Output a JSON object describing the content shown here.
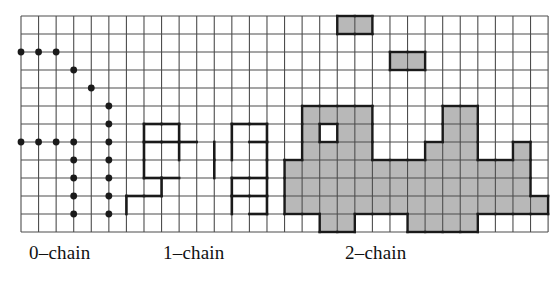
{
  "figure": {
    "background_color": "#ffffff",
    "ink_color": "#1a1a1a",
    "grid_line_color": "#4d4d4d",
    "fill_color": "#b8b8b8",
    "grid": {
      "origin_x": 21,
      "origin_y": 16,
      "cell_w": 17.57,
      "cell_h": 18.0,
      "cols": 30,
      "rows": 12,
      "line_width": 1.1
    },
    "styles": {
      "vertex_radius": 3.4,
      "edge_width": 2.6,
      "face_outline_width": 2.4
    }
  },
  "captions": [
    {
      "name": "zero-chain-label",
      "text": "0–chain",
      "x": 29,
      "y": 242
    },
    {
      "name": "one-chain-label",
      "text": "1–chain",
      "x": 163,
      "y": 242
    },
    {
      "name": "two-chain-label",
      "text": "2–chain",
      "x": 345,
      "y": 242
    }
  ],
  "chain_data": {
    "type": "diagram",
    "description": "Simplicial chains drawn on a 30x12 square lattice: 0-chain as marked vertices, 1-chain as highlighted edges, 2-chain as shaded faces.",
    "zero_chain": {
      "label": "0–chain",
      "element_type": "vertex",
      "count": 19,
      "vertices": [
        [
          0,
          2
        ],
        [
          1,
          2
        ],
        [
          2,
          2
        ],
        [
          3,
          3
        ],
        [
          4,
          4
        ],
        [
          5,
          5
        ],
        [
          5,
          6
        ],
        [
          5,
          7
        ],
        [
          5,
          8
        ],
        [
          5,
          9
        ],
        [
          5,
          10
        ],
        [
          5,
          11
        ],
        [
          0,
          7
        ],
        [
          1,
          7
        ],
        [
          2,
          7
        ],
        [
          3,
          7
        ],
        [
          3,
          8
        ],
        [
          3,
          9
        ],
        [
          3,
          10
        ],
        [
          3,
          11
        ]
      ]
    },
    "one_chain": {
      "label": "1–chain",
      "element_type": "edge",
      "count": 26,
      "horizontal_edges": [
        [
          7,
          7
        ],
        [
          8,
          7
        ],
        [
          9,
          7
        ],
        [
          7,
          9
        ],
        [
          8,
          9
        ],
        [
          6,
          10
        ],
        [
          7,
          10
        ],
        [
          7,
          6
        ],
        [
          8,
          6
        ],
        [
          12,
          6
        ],
        [
          13,
          6
        ],
        [
          13,
          7
        ],
        [
          12,
          9
        ],
        [
          13,
          9
        ],
        [
          12,
          10
        ],
        [
          13,
          10
        ],
        [
          13,
          11
        ]
      ],
      "vertical_edges": [
        [
          7,
          6
        ],
        [
          9,
          6
        ],
        [
          9,
          7
        ],
        [
          7,
          7
        ],
        [
          7,
          8
        ],
        [
          8,
          9
        ],
        [
          6,
          10
        ],
        [
          11,
          7
        ],
        [
          11,
          8
        ],
        [
          12,
          6
        ],
        [
          14,
          6
        ],
        [
          12,
          7
        ],
        [
          14,
          7
        ],
        [
          14,
          8
        ],
        [
          12,
          9
        ],
        [
          12,
          10
        ],
        [
          14,
          9
        ],
        [
          14,
          10
        ]
      ]
    },
    "two_chain": {
      "label": "2–chain",
      "element_type": "face",
      "count": 72,
      "filled_cells": [
        [
          18,
          0
        ],
        [
          19,
          0
        ],
        [
          21,
          2
        ],
        [
          22,
          2
        ],
        [
          16,
          5
        ],
        [
          17,
          5
        ],
        [
          18,
          5
        ],
        [
          19,
          5
        ],
        [
          24,
          5
        ],
        [
          25,
          5
        ],
        [
          16,
          6
        ],
        [
          18,
          6
        ],
        [
          19,
          6
        ],
        [
          24,
          6
        ],
        [
          25,
          6
        ],
        [
          16,
          7
        ],
        [
          17,
          7
        ],
        [
          18,
          7
        ],
        [
          19,
          7
        ],
        [
          23,
          7
        ],
        [
          24,
          7
        ],
        [
          25,
          7
        ],
        [
          28,
          7
        ],
        [
          15,
          8
        ],
        [
          16,
          8
        ],
        [
          17,
          8
        ],
        [
          18,
          8
        ],
        [
          19,
          8
        ],
        [
          20,
          8
        ],
        [
          21,
          8
        ],
        [
          22,
          8
        ],
        [
          23,
          8
        ],
        [
          24,
          8
        ],
        [
          25,
          8
        ],
        [
          26,
          8
        ],
        [
          27,
          8
        ],
        [
          28,
          8
        ],
        [
          15,
          9
        ],
        [
          16,
          9
        ],
        [
          17,
          9
        ],
        [
          18,
          9
        ],
        [
          19,
          9
        ],
        [
          20,
          9
        ],
        [
          21,
          9
        ],
        [
          22,
          9
        ],
        [
          23,
          9
        ],
        [
          24,
          9
        ],
        [
          25,
          9
        ],
        [
          26,
          9
        ],
        [
          27,
          9
        ],
        [
          28,
          9
        ],
        [
          15,
          10
        ],
        [
          16,
          10
        ],
        [
          17,
          10
        ],
        [
          18,
          10
        ],
        [
          19,
          10
        ],
        [
          20,
          10
        ],
        [
          21,
          10
        ],
        [
          22,
          10
        ],
        [
          23,
          10
        ],
        [
          24,
          10
        ],
        [
          25,
          10
        ],
        [
          26,
          10
        ],
        [
          27,
          10
        ],
        [
          28,
          10
        ],
        [
          29,
          10
        ],
        [
          17,
          11
        ],
        [
          18,
          11
        ],
        [
          22,
          11
        ],
        [
          23,
          11
        ],
        [
          24,
          11
        ],
        [
          25,
          11
        ]
      ]
    }
  }
}
